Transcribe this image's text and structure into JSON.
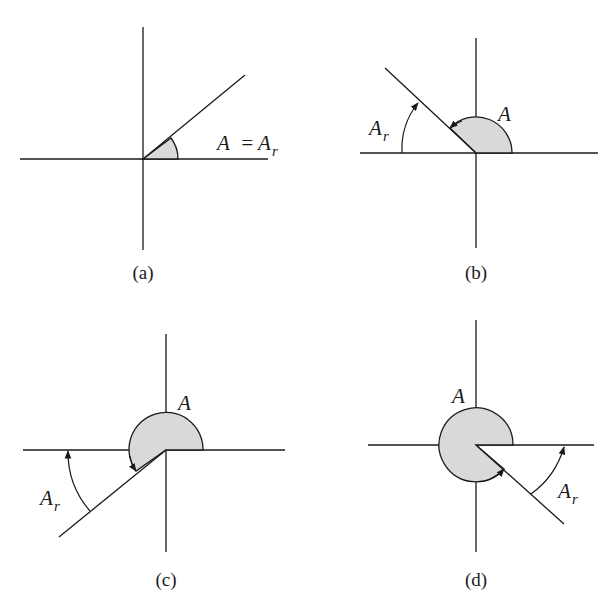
{
  "figure": {
    "panels": [
      {
        "id": "a",
        "caption": "(a)",
        "angle_label": "A",
        "equals": "=",
        "ref_label": "A",
        "ref_sub": "r",
        "description": "Angle A in quadrant I equals its reference angle A_r"
      },
      {
        "id": "b",
        "caption": "(b)",
        "angle_label": "A",
        "ref_label": "A",
        "ref_sub": "r",
        "description": "Angle A in quadrant II; reference angle measured from negative x-axis"
      },
      {
        "id": "c",
        "caption": "(c)",
        "angle_label": "A",
        "ref_label": "A",
        "ref_sub": "r",
        "description": "Angle A in quadrant III; reference angle measured from negative x-axis"
      },
      {
        "id": "d",
        "caption": "(d)",
        "angle_label": "A",
        "ref_label": "A",
        "ref_sub": "r",
        "description": "Angle A in quadrant IV; reference angle measured from positive x-axis"
      }
    ],
    "colors": {
      "line": "#1a1a1a",
      "shade": "#d9d9d9",
      "background": "#ffffff"
    }
  }
}
